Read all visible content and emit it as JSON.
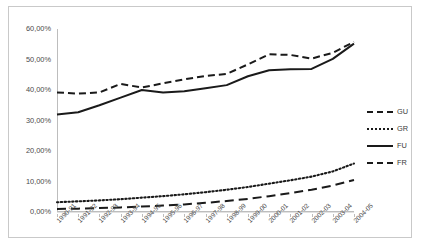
{
  "chart_data": {
    "type": "line",
    "title": "",
    "xlabel": "",
    "ylabel": "",
    "ylim": [
      0,
      60
    ],
    "ytick_labels": [
      "60,00%",
      "50,00%",
      "40,00%",
      "30,00%",
      "20,00%",
      "10,00%",
      "0,00%"
    ],
    "ytick_values": [
      60,
      50,
      40,
      30,
      20,
      10,
      0
    ],
    "grid": true,
    "legend_position": "right",
    "categories": [
      "1990-91",
      "1991-92",
      "1992-93",
      "1993-94",
      "1994-95",
      "1995-96",
      "1996-97",
      "1997-98",
      "1998-99",
      "1999-00",
      "2000-01",
      "2001-02",
      "2002-03",
      "2003-04",
      "2004-05"
    ],
    "series": [
      {
        "name": "GU",
        "style": "dashed",
        "values": [
          39.2,
          38.8,
          39.2,
          42.0,
          40.8,
          42.2,
          43.5,
          44.6,
          45.3,
          48.4,
          51.7,
          51.5,
          50.3,
          52.2,
          55.8
        ]
      },
      {
        "name": "GR",
        "style": "dotted",
        "values": [
          3.2,
          3.5,
          3.8,
          4.2,
          4.7,
          5.2,
          5.8,
          6.5,
          7.3,
          8.2,
          9.3,
          10.4,
          11.6,
          13.3,
          15.9
        ]
      },
      {
        "name": "FU",
        "style": "solid",
        "values": [
          32.0,
          32.7,
          35.0,
          37.5,
          40.0,
          39.2,
          39.6,
          40.6,
          41.6,
          44.5,
          46.5,
          46.8,
          46.9,
          50.2,
          55.2
        ]
      },
      {
        "name": "FR",
        "style": "long-dash",
        "values": [
          1.0,
          1.1,
          1.3,
          1.5,
          1.8,
          2.1,
          2.5,
          3.0,
          3.6,
          4.3,
          5.2,
          6.2,
          7.3,
          8.7,
          10.5
        ]
      }
    ]
  },
  "legend": {
    "items": [
      {
        "label": "GU"
      },
      {
        "label": "GR"
      },
      {
        "label": "FU"
      },
      {
        "label": "FR"
      }
    ]
  },
  "colors": {
    "line": "#1a1a1a",
    "grid": "#e2e2e2",
    "axis": "#bdbdbd",
    "border": "#c9c9c9",
    "text": "#4a4a4a",
    "background": "#ffffff"
  }
}
